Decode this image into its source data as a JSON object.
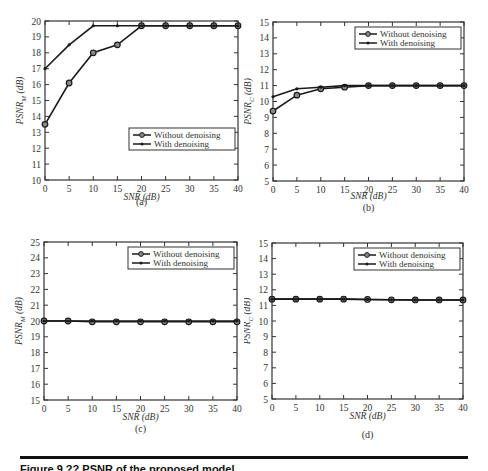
{
  "chart_data": [
    {
      "id": "a",
      "type": "line",
      "panel_label": "(a)",
      "xlabel": "SNR (dB)",
      "ylabel": "PSNR_M (dB)",
      "ylabel_main": "PSNR",
      "ylabel_sub": "M",
      "ylabel_unit": " (dB)",
      "x": [
        0,
        5,
        10,
        15,
        20,
        25,
        30,
        35,
        40
      ],
      "xticks": [
        0,
        5,
        10,
        15,
        20,
        25,
        30,
        35,
        40
      ],
      "yticks": [
        10,
        11,
        12,
        13,
        14,
        15,
        16,
        17,
        18,
        19,
        20
      ],
      "xlim": [
        0,
        40
      ],
      "ylim": [
        10,
        20
      ],
      "grid": false,
      "legend_position": "lower right",
      "series": [
        {
          "name": "Without denoising",
          "marker": "circle",
          "values": [
            13.5,
            16.1,
            18.0,
            18.5,
            19.7,
            19.7,
            19.7,
            19.7,
            19.7
          ]
        },
        {
          "name": "With denoising",
          "marker": "dot",
          "values": [
            17.0,
            18.5,
            19.7,
            19.7,
            19.7,
            19.7,
            19.7,
            19.7,
            19.7
          ]
        }
      ]
    },
    {
      "id": "b",
      "type": "line",
      "panel_label": "(b)",
      "xlabel": "SNR (dB)",
      "ylabel": "PSNR_C (dB)",
      "ylabel_main": "PSNR",
      "ylabel_sub": "C",
      "ylabel_unit": " (dB)",
      "x": [
        0,
        5,
        10,
        15,
        20,
        25,
        30,
        35,
        40
      ],
      "xticks": [
        0,
        5,
        10,
        15,
        20,
        25,
        30,
        35,
        40
      ],
      "yticks": [
        5,
        6,
        7,
        8,
        9,
        10,
        11,
        12,
        13,
        14,
        15
      ],
      "xlim": [
        0,
        40
      ],
      "ylim": [
        5,
        15
      ],
      "grid": false,
      "legend_position": "upper right",
      "series": [
        {
          "name": "Without denoising",
          "marker": "circle",
          "values": [
            9.4,
            10.4,
            10.8,
            10.9,
            11.0,
            11.0,
            11.0,
            11.0,
            11.0
          ]
        },
        {
          "name": "With denoising",
          "marker": "dot",
          "values": [
            10.3,
            10.8,
            10.9,
            11.0,
            11.0,
            11.0,
            11.0,
            11.0,
            11.0
          ]
        }
      ]
    },
    {
      "id": "c",
      "type": "line",
      "panel_label": "(c)",
      "xlabel": "SNR (dB)",
      "ylabel": "PSNR_M (dB)",
      "ylabel_main": "PSNR",
      "ylabel_sub": "M",
      "ylabel_unit": " (dB)",
      "x": [
        0,
        5,
        10,
        15,
        20,
        25,
        30,
        35,
        40
      ],
      "xticks": [
        0,
        5,
        10,
        15,
        20,
        25,
        30,
        35,
        40
      ],
      "yticks": [
        15,
        16,
        17,
        18,
        19,
        20,
        21,
        22,
        23,
        24,
        25
      ],
      "xlim": [
        0,
        40
      ],
      "ylim": [
        15,
        25
      ],
      "grid": false,
      "legend_position": "upper right",
      "series": [
        {
          "name": "Without denoising",
          "marker": "circle",
          "values": [
            20.0,
            20.0,
            19.95,
            19.95,
            19.95,
            19.95,
            19.95,
            19.95,
            19.95
          ]
        },
        {
          "name": "With denoising",
          "marker": "dot",
          "values": [
            20.0,
            20.0,
            20.0,
            20.0,
            20.0,
            20.0,
            20.0,
            20.0,
            20.0
          ]
        }
      ]
    },
    {
      "id": "d",
      "type": "line",
      "panel_label": "(d)",
      "xlabel": "SNR (dB)",
      "ylabel": "PSNR_C (dB)",
      "ylabel_main": "PSNR",
      "ylabel_sub": "C",
      "ylabel_unit": " (dB)",
      "x": [
        0,
        5,
        10,
        15,
        20,
        25,
        30,
        35,
        40
      ],
      "xticks": [
        0,
        5,
        10,
        15,
        20,
        25,
        30,
        35,
        40
      ],
      "yticks": [
        5,
        6,
        7,
        8,
        9,
        10,
        11,
        12,
        13,
        14,
        15
      ],
      "xlim": [
        0,
        40
      ],
      "ylim": [
        5,
        15
      ],
      "grid": false,
      "legend_position": "upper right",
      "series": [
        {
          "name": "Without denoising",
          "marker": "circle",
          "values": [
            11.4,
            11.4,
            11.4,
            11.4,
            11.38,
            11.36,
            11.35,
            11.35,
            11.35
          ]
        },
        {
          "name": "With denoising",
          "marker": "dot",
          "values": [
            11.4,
            11.4,
            11.4,
            11.4,
            11.38,
            11.36,
            11.35,
            11.35,
            11.35
          ]
        }
      ]
    }
  ],
  "caption": {
    "text": "Figure 9.??  PSNR of the proposed model..."
  }
}
